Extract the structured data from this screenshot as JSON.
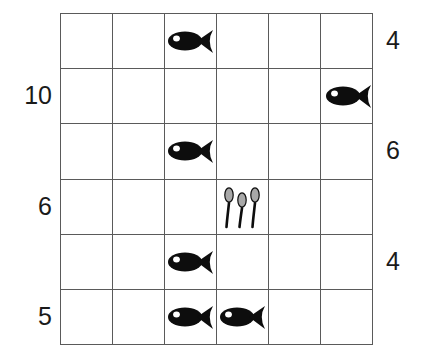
{
  "worksheet": {
    "title": "fish and spoons grid",
    "grid": {
      "rows": 6,
      "columns": 6,
      "line_color": "#5a5a5a",
      "background": "#ffffff"
    },
    "icons": {
      "fish": {
        "name": "fish-icon",
        "body_color": "#0d0d0d",
        "eye_color": "#ffffff",
        "direction": "right"
      },
      "spoons": {
        "name": "spoons-icon",
        "count": 3,
        "bowl_color": "#a8a8a8",
        "handle_color": "#0d0d0d"
      }
    },
    "row_labels_left": [
      {
        "row": 1,
        "value": ""
      },
      {
        "row": 2,
        "value": "10"
      },
      {
        "row": 3,
        "value": ""
      },
      {
        "row": 4,
        "value": "6"
      },
      {
        "row": 5,
        "value": ""
      },
      {
        "row": 6,
        "value": "5"
      }
    ],
    "row_labels_right": [
      {
        "row": 1,
        "value": "4"
      },
      {
        "row": 2,
        "value": ""
      },
      {
        "row": 3,
        "value": "6"
      },
      {
        "row": 4,
        "value": ""
      },
      {
        "row": 5,
        "value": "4"
      },
      {
        "row": 6,
        "value": ""
      }
    ],
    "cells": [
      {
        "row": 1,
        "col": 1,
        "content": ""
      },
      {
        "row": 1,
        "col": 2,
        "content": ""
      },
      {
        "row": 1,
        "col": 3,
        "content": "fish"
      },
      {
        "row": 1,
        "col": 4,
        "content": ""
      },
      {
        "row": 1,
        "col": 5,
        "content": ""
      },
      {
        "row": 1,
        "col": 6,
        "content": ""
      },
      {
        "row": 2,
        "col": 1,
        "content": ""
      },
      {
        "row": 2,
        "col": 2,
        "content": ""
      },
      {
        "row": 2,
        "col": 3,
        "content": ""
      },
      {
        "row": 2,
        "col": 4,
        "content": ""
      },
      {
        "row": 2,
        "col": 5,
        "content": ""
      },
      {
        "row": 2,
        "col": 6,
        "content": "fish"
      },
      {
        "row": 3,
        "col": 1,
        "content": ""
      },
      {
        "row": 3,
        "col": 2,
        "content": ""
      },
      {
        "row": 3,
        "col": 3,
        "content": "fish"
      },
      {
        "row": 3,
        "col": 4,
        "content": ""
      },
      {
        "row": 3,
        "col": 5,
        "content": ""
      },
      {
        "row": 3,
        "col": 6,
        "content": ""
      },
      {
        "row": 4,
        "col": 1,
        "content": ""
      },
      {
        "row": 4,
        "col": 2,
        "content": ""
      },
      {
        "row": 4,
        "col": 3,
        "content": ""
      },
      {
        "row": 4,
        "col": 4,
        "content": "spoons"
      },
      {
        "row": 4,
        "col": 5,
        "content": ""
      },
      {
        "row": 4,
        "col": 6,
        "content": ""
      },
      {
        "row": 5,
        "col": 1,
        "content": ""
      },
      {
        "row": 5,
        "col": 2,
        "content": ""
      },
      {
        "row": 5,
        "col": 3,
        "content": "fish"
      },
      {
        "row": 5,
        "col": 4,
        "content": ""
      },
      {
        "row": 5,
        "col": 5,
        "content": ""
      },
      {
        "row": 5,
        "col": 6,
        "content": ""
      },
      {
        "row": 6,
        "col": 1,
        "content": ""
      },
      {
        "row": 6,
        "col": 2,
        "content": ""
      },
      {
        "row": 6,
        "col": 3,
        "content": "fish"
      },
      {
        "row": 6,
        "col": 4,
        "content": "fish"
      },
      {
        "row": 6,
        "col": 5,
        "content": ""
      },
      {
        "row": 6,
        "col": 6,
        "content": ""
      }
    ]
  }
}
